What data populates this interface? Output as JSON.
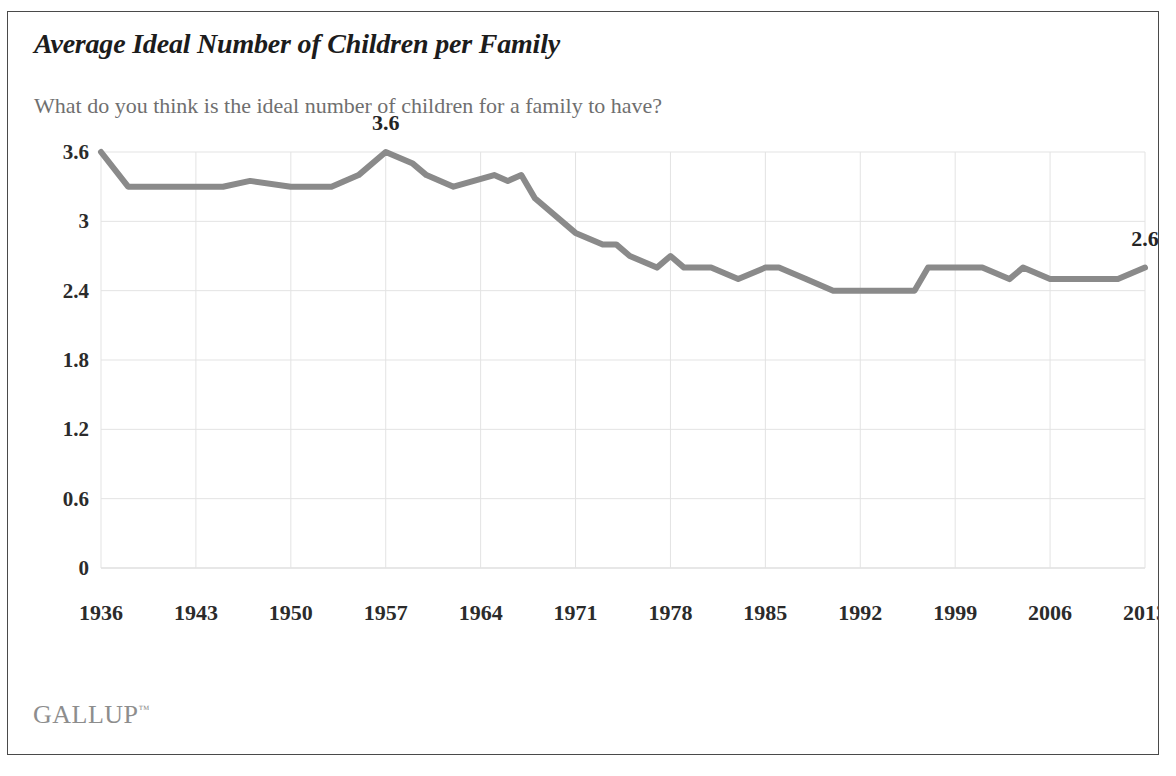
{
  "header": {
    "title": "Average Ideal Number of Children per Family",
    "subtitle": "What do you think is the ideal number of children for a family to have?"
  },
  "footer": {
    "brand": "GALLUP",
    "trademark": "™"
  },
  "colors": {
    "line": "#8a8a8a",
    "grid": "#e3e3e3",
    "axis": "#cfcfcf",
    "title": "#1c1c1c",
    "subtitle": "#6f6f6f",
    "tick": "#2b2b2b",
    "brand": "#8d8d8d",
    "border": "#4a4a4a"
  },
  "chart_data": {
    "type": "line",
    "title": "Average Ideal Number of Children per Family",
    "subtitle": "What do you think is the ideal number of children for a family to have?",
    "xlabel": "",
    "ylabel": "",
    "ylim": [
      0,
      3.6
    ],
    "xlim": [
      1936,
      2013
    ],
    "grid": true,
    "legend": "none",
    "yticks": [
      0,
      0.6,
      1.2,
      1.8,
      2.4,
      3,
      3.6
    ],
    "ytick_labels": [
      "0",
      "0.6",
      "1.2",
      "1.8",
      "2.4",
      "3",
      "3.6"
    ],
    "xticks": [
      1936,
      1943,
      1950,
      1957,
      1964,
      1971,
      1978,
      1985,
      1992,
      1999,
      2006,
      2013
    ],
    "xtick_labels": [
      "1936",
      "1943",
      "1950",
      "1957",
      "1964",
      "1971",
      "1978",
      "1985",
      "1992",
      "1999",
      "2006",
      "2013"
    ],
    "series": [
      {
        "name": "Average ideal number of children",
        "x": [
          1936,
          1938,
          1941,
          1945,
          1947,
          1950,
          1953,
          1955,
          1957,
          1959,
          1960,
          1962,
          1965,
          1966,
          1967,
          1968,
          1971,
          1973,
          1974,
          1975,
          1977,
          1978,
          1979,
          1980,
          1981,
          1983,
          1985,
          1986,
          1988,
          1990,
          1992,
          1994,
          1996,
          1997,
          1999,
          2001,
          2003,
          2004,
          2006,
          2007,
          2011,
          2013
        ],
        "values": [
          3.6,
          3.3,
          3.3,
          3.3,
          3.35,
          3.3,
          3.3,
          3.4,
          3.6,
          3.5,
          3.4,
          3.3,
          3.4,
          3.35,
          3.4,
          3.2,
          2.9,
          2.8,
          2.8,
          2.7,
          2.6,
          2.7,
          2.6,
          2.6,
          2.6,
          2.5,
          2.6,
          2.6,
          2.5,
          2.4,
          2.4,
          2.4,
          2.4,
          2.6,
          2.6,
          2.6,
          2.5,
          2.6,
          2.5,
          2.5,
          2.5,
          2.6
        ]
      }
    ],
    "annotations": [
      {
        "label": "3.6",
        "x": 1957,
        "y": 3.6
      },
      {
        "label": "2.6",
        "x": 2013,
        "y": 2.6
      }
    ]
  }
}
